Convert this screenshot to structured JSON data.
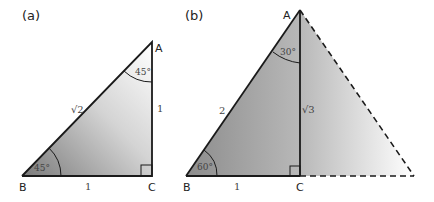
{
  "panels": [
    {
      "label": "(a)",
      "vertices": {
        "A": "A",
        "B": "B",
        "C": "C"
      },
      "sides": {
        "hypotenuse": "√2",
        "base": "1",
        "vertical": "1"
      },
      "angles": {
        "at_A": "45°",
        "at_B": "45°"
      },
      "right_angle_at": "C"
    },
    {
      "label": "(b)",
      "vertices": {
        "A": "A",
        "B": "B",
        "C": "C"
      },
      "sides": {
        "hypotenuse": "2",
        "base": "1",
        "vertical": "√3"
      },
      "angles": {
        "at_A": "30°",
        "at_B": "60°"
      },
      "right_angle_at": "C",
      "dashed_mirror_half": true
    }
  ],
  "colors": {
    "line": "#1a1a1a",
    "shade_dark": "#8a8a8a",
    "shade_light": "#ffffff"
  }
}
